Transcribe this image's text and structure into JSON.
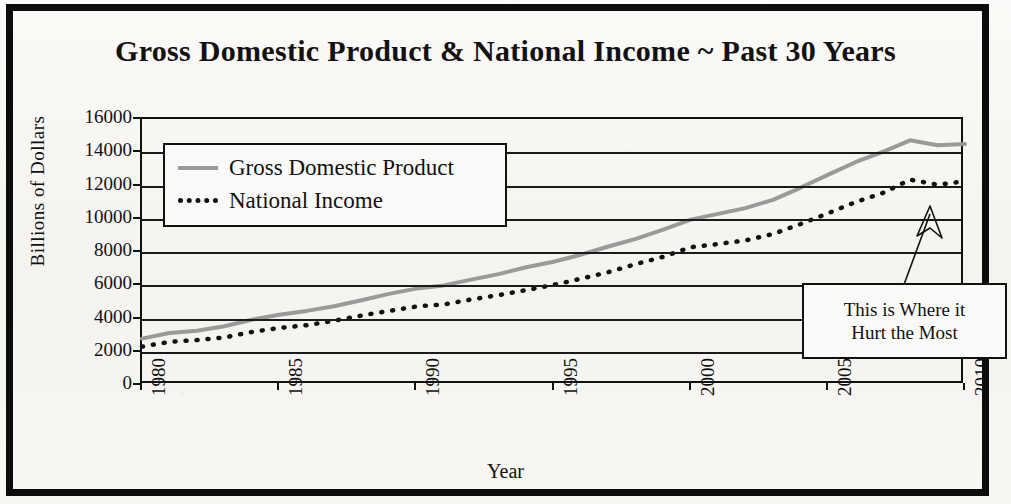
{
  "chart_data": {
    "type": "line",
    "title": "Gross Domestic Product & National Income ~ Past 30 Years",
    "xlabel": "Year",
    "ylabel": "Billions of Dollars",
    "xlim": [
      1980,
      2010
    ],
    "ylim": [
      0,
      16000
    ],
    "ytick_values": [
      16000,
      14000,
      12000,
      10000,
      8000,
      6000,
      4000,
      2000,
      0
    ],
    "ytick_labels": [
      "16000",
      "14000",
      "12000",
      "10000",
      "8000",
      "6000",
      "4000",
      "2000",
      "0"
    ],
    "xtick_values": [
      1980,
      1985,
      1990,
      1995,
      2000,
      2005,
      2010
    ],
    "xtick_labels": [
      "1980",
      "1985",
      "1990",
      "1995",
      "2000",
      "2005",
      "2010"
    ],
    "grid": "horizontal",
    "legend_position": "upper-left-inside",
    "x": [
      1980,
      1981,
      1982,
      1983,
      1984,
      1985,
      1986,
      1987,
      1988,
      1989,
      1990,
      1991,
      1992,
      1993,
      1994,
      1995,
      1996,
      1997,
      1998,
      1999,
      2000,
      2001,
      2002,
      2003,
      2004,
      2005,
      2006,
      2007,
      2008,
      2009,
      2010
    ],
    "series": [
      {
        "name": "Gross Domestic Product",
        "style": "solid",
        "color": "#9a9a9a",
        "values": [
          2790,
          3130,
          3260,
          3530,
          3930,
          4220,
          4460,
          4740,
          5100,
          5480,
          5800,
          5990,
          6340,
          6670,
          7080,
          7410,
          7840,
          8330,
          8790,
          9350,
          9950,
          10290,
          10640,
          11140,
          11860,
          12640,
          13400,
          14030,
          14720,
          14420,
          14500
        ]
      },
      {
        "name": "National Income",
        "style": "dotted",
        "color": "#111111",
        "values": [
          2310,
          2590,
          2700,
          2860,
          3190,
          3430,
          3600,
          3860,
          4180,
          4450,
          4720,
          4850,
          5140,
          5410,
          5710,
          6020,
          6390,
          6790,
          7270,
          7710,
          8290,
          8480,
          8700,
          9080,
          9680,
          10320,
          11000,
          11550,
          12350,
          12050,
          12250
        ]
      }
    ],
    "annotation": {
      "line1": "This is Where it",
      "line2": "Hurt the Most",
      "points_to_year": 2009,
      "arrow": "up-arrow-icon"
    }
  }
}
